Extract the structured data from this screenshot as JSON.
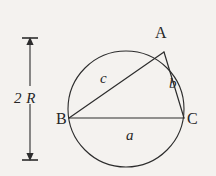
{
  "figure": {
    "kind": "geometry-diagram",
    "background_color": "#f4f2ef",
    "stroke_color": "#262626",
    "circle": {
      "name": "circumcircle",
      "cx": 126,
      "cy": 109,
      "r": 58
    },
    "vertices": [
      {
        "id": "A",
        "label": "A",
        "x": 164,
        "y": 52
      },
      {
        "id": "B",
        "label": "B",
        "x": 69,
        "y": 118
      },
      {
        "id": "C",
        "label": "C",
        "x": 184,
        "y": 118
      }
    ],
    "sides": [
      {
        "id": "a",
        "label": "a",
        "from": "B",
        "to": "C"
      },
      {
        "id": "b",
        "label": "b",
        "from": "A",
        "to": "C"
      },
      {
        "id": "c",
        "label": "c",
        "from": "B",
        "to": "A"
      }
    ],
    "dimension": {
      "label": "2 R",
      "meaning": "diameter",
      "x": 30,
      "top_y": 38,
      "bottom_y": 160,
      "arrowheads": "both"
    }
  }
}
